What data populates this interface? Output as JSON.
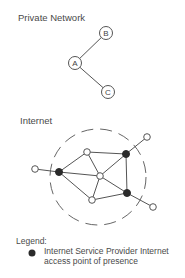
{
  "private_network": {
    "title": "Private Network",
    "nodes": [
      {
        "id": "A",
        "label": "A",
        "x": 75,
        "y": 63
      },
      {
        "id": "B",
        "label": "B",
        "x": 106,
        "y": 33
      },
      {
        "id": "C",
        "label": "C",
        "x": 108,
        "y": 92
      }
    ],
    "edges": [
      [
        "A",
        "B"
      ],
      [
        "A",
        "C"
      ]
    ]
  },
  "internet": {
    "title": "Internet",
    "boundary": {
      "shape": "dashed-circle",
      "cx": 98,
      "cy": 177,
      "r": 48
    },
    "nodes": [
      {
        "id": "isp1",
        "type": "isp",
        "x": 59,
        "y": 172
      },
      {
        "id": "isp2",
        "type": "isp",
        "x": 126,
        "y": 154
      },
      {
        "id": "isp3",
        "type": "isp",
        "x": 127,
        "y": 193
      },
      {
        "id": "r_top",
        "type": "router",
        "x": 87,
        "y": 152
      },
      {
        "id": "r_center",
        "type": "router",
        "x": 100,
        "y": 176
      },
      {
        "id": "r_bottom",
        "type": "router",
        "x": 92,
        "y": 200
      },
      {
        "id": "ext_left",
        "type": "external",
        "x": 35,
        "y": 169
      },
      {
        "id": "ext_topright",
        "type": "external",
        "x": 147,
        "y": 137
      },
      {
        "id": "ext_bottomright",
        "type": "external",
        "x": 153,
        "y": 207
      }
    ],
    "colors": {
      "isp": "#2a2a2a",
      "router": "#ffffff",
      "stroke": "#555555",
      "boundary": "#666666"
    }
  },
  "legend": {
    "title": "Legend:",
    "items": [
      {
        "icon": "filled-circle-icon",
        "text": "Internet Service Provider Internet access point of presence"
      }
    ]
  }
}
